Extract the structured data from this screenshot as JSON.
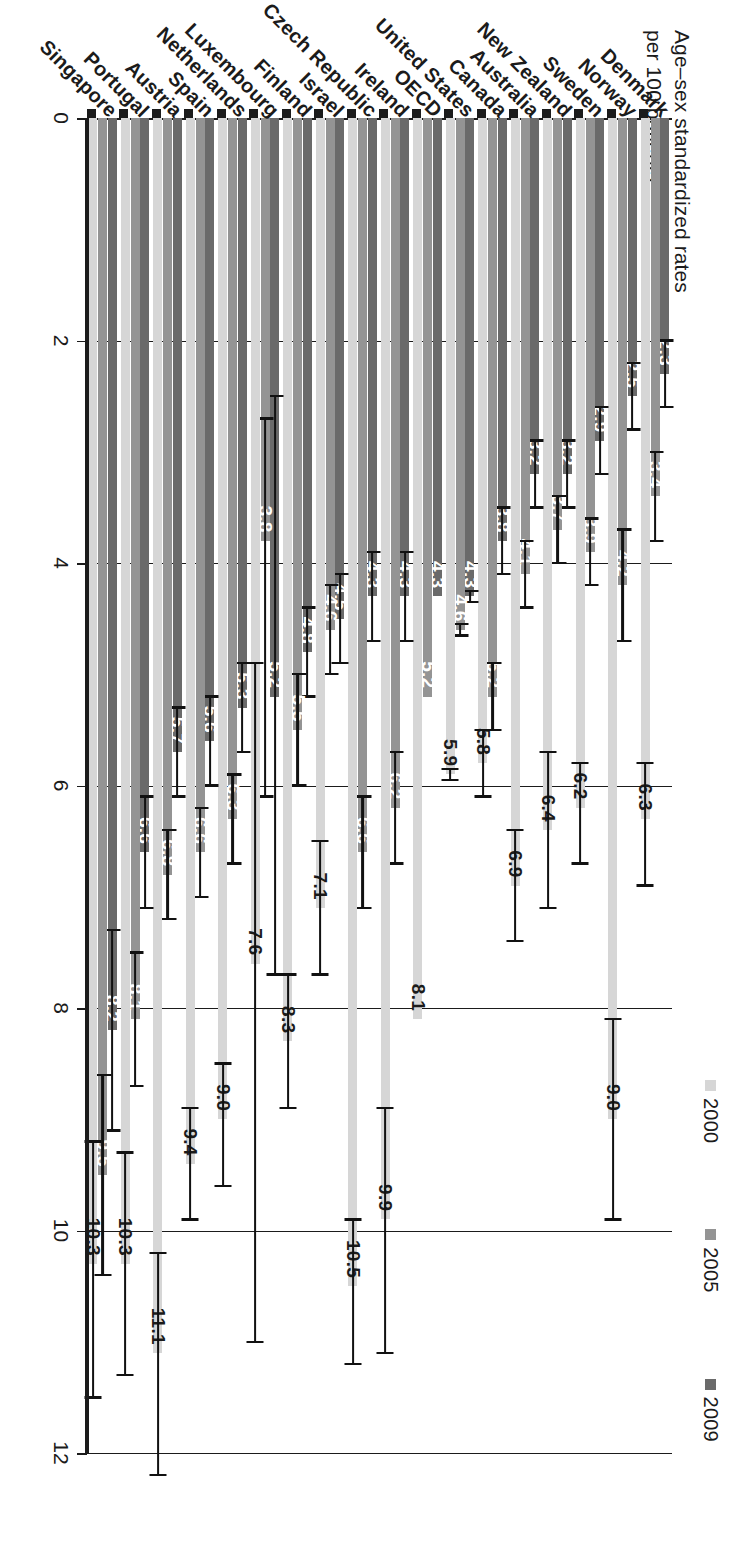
{
  "chart_data": {
    "type": "bar",
    "orientation": "vertical-grouped-rendered-rotated",
    "title": "",
    "xlabel": "",
    "ylabel": "Age–sex standardized rates per 100 patients",
    "ylim": [
      0,
      12
    ],
    "yticks": [
      0,
      2,
      4,
      6,
      8,
      10,
      12
    ],
    "grid": true,
    "legend_position": "top-right",
    "categories": [
      "Denmark",
      "Norway",
      "Sweden",
      "New Zealand",
      "Australia",
      "Canada",
      "United States",
      "OECD",
      "Ireland",
      "Czech Republic",
      "Israel",
      "Finland",
      "Luxembourg",
      "Netherlands",
      "Spain",
      "Austria",
      "Portugal",
      "Singapore"
    ],
    "series": [
      {
        "name": "2000",
        "color": "#d6d6d6",
        "values": [
          6.3,
          9.0,
          6.2,
          6.4,
          6.9,
          5.8,
          5.9,
          8.1,
          9.9,
          10.5,
          7.1,
          8.3,
          7.6,
          9.0,
          9.4,
          11.1,
          10.3,
          10.3
        ],
        "err_low": [
          5.8,
          8.1,
          5.8,
          5.7,
          6.4,
          5.5,
          5.85,
          null,
          8.9,
          9.9,
          6.5,
          7.7,
          4.9,
          8.5,
          8.9,
          10.2,
          9.3,
          9.2
        ],
        "err_high": [
          6.9,
          9.9,
          6.7,
          7.1,
          7.4,
          6.1,
          5.95,
          null,
          11.1,
          11.2,
          7.7,
          8.9,
          11.0,
          9.6,
          9.9,
          12.2,
          11.3,
          11.5
        ]
      },
      {
        "name": "2005",
        "color": "#949494",
        "values": [
          3.4,
          4.2,
          3.9,
          3.7,
          4.1,
          5.2,
          4.6,
          5.2,
          6.2,
          6.6,
          4.6,
          5.5,
          3.8,
          6.3,
          6.6,
          6.8,
          8.1,
          9.5
        ],
        "err_low": [
          3.0,
          3.7,
          3.6,
          3.4,
          3.8,
          4.9,
          4.55,
          null,
          5.7,
          6.1,
          4.2,
          5.0,
          2.7,
          5.9,
          6.2,
          6.4,
          7.5,
          8.6
        ],
        "err_high": [
          3.8,
          4.7,
          4.2,
          4.0,
          4.4,
          5.5,
          4.65,
          null,
          6.7,
          7.1,
          5.0,
          6.0,
          6.1,
          6.7,
          7.0,
          7.2,
          8.7,
          10.4
        ]
      },
      {
        "name": "2009",
        "color": "#6a6a6a",
        "values": [
          2.3,
          2.5,
          2.9,
          3.2,
          3.2,
          3.8,
          4.3,
          4.3,
          4.3,
          4.3,
          4.5,
          4.8,
          5.2,
          5.3,
          5.6,
          5.7,
          6.6,
          8.2
        ],
        "err_low": [
          2.0,
          2.2,
          2.6,
          2.9,
          2.9,
          3.5,
          4.25,
          null,
          3.9,
          3.9,
          4.1,
          4.4,
          2.5,
          4.9,
          5.2,
          5.3,
          6.1,
          7.3
        ],
        "err_high": [
          2.6,
          2.8,
          3.2,
          3.5,
          3.5,
          4.1,
          4.35,
          null,
          4.7,
          4.7,
          4.9,
          5.2,
          7.7,
          5.7,
          6.0,
          6.1,
          7.1,
          9.1
        ]
      }
    ]
  },
  "axis": {
    "title": "Age–sex standardized rates\nper 100 patients",
    "title_line1": "Age–sex standardized rates",
    "title_line2": "per 100 patients"
  },
  "legend": {
    "items": [
      {
        "label": "2000",
        "color": "#d6d6d6"
      },
      {
        "label": "2005",
        "color": "#949494"
      },
      {
        "label": "2009",
        "color": "#6a6a6a"
      }
    ]
  }
}
